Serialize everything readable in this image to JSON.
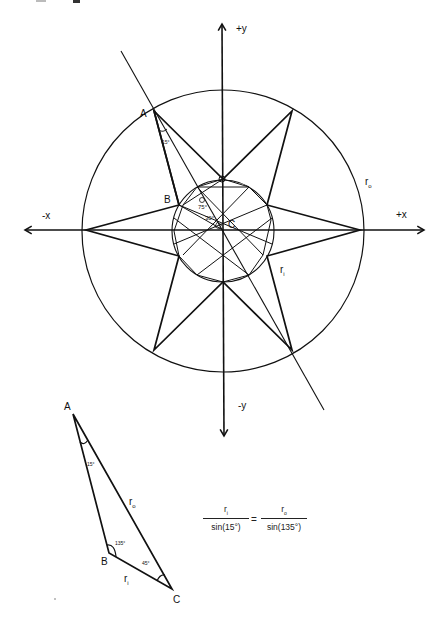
{
  "header": {
    "title_fragment": "…p…g…"
  },
  "axes": {
    "pos_y": "+y",
    "neg_y": "-y",
    "pos_x": "+x",
    "neg_x": "-x"
  },
  "main_figure": {
    "outer_radius_label": "r",
    "outer_radius_sub": "o",
    "inner_radius_label": "r",
    "inner_radius_sub": "i",
    "point_a": "A",
    "point_b": "B",
    "point_c": "C",
    "angle_at_a": "15°",
    "angle_at_b": "75°",
    "angle_at_c": "30°",
    "star_points": 6
  },
  "triangle": {
    "point_a": "A",
    "point_b": "B",
    "point_c": "C",
    "angle_a": "15°",
    "angle_b": "135°",
    "angle_c": "45°",
    "side_ac_label": "r",
    "side_ac_sub": "o",
    "side_bc_label": "r",
    "side_bc_sub": "i"
  },
  "equation": {
    "left_num": "r",
    "left_num_sub": "i",
    "left_den": "sin(15°)",
    "equals": "=",
    "right_num": "r",
    "right_num_sub": "o",
    "right_den": "sin(135°)"
  },
  "colors": {
    "stroke": "#111111",
    "background": "#ffffff"
  }
}
